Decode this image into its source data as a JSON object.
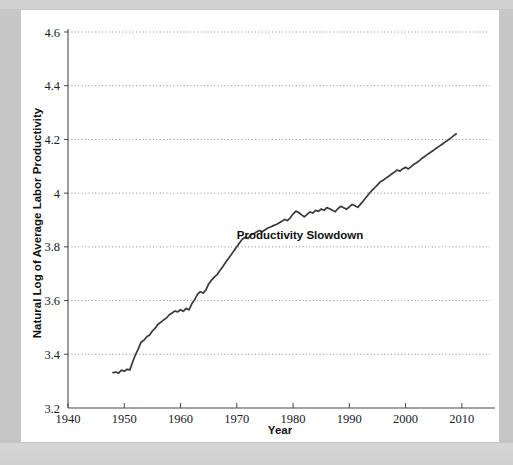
{
  "figure": {
    "background_color": "#c6c6c6",
    "card_color": "#ffffff",
    "line_color": "#3a3a38",
    "grid_color": "#8a8a8a",
    "axis_color": "#4a4a4a"
  },
  "chart_data": {
    "type": "line",
    "title": "",
    "xlabel": "Year",
    "ylabel": "Natural Log of Average Labor Productivity",
    "xlim": [
      1940,
      2015
    ],
    "ylim": [
      3.2,
      4.6
    ],
    "grid": "horizontal-dotted",
    "legend": "none",
    "xticks": [
      1940,
      1950,
      1960,
      1970,
      1980,
      1990,
      2000,
      2010
    ],
    "xtick_labels": [
      "1940",
      "1950",
      "1960",
      "1970",
      "1980",
      "1990",
      "2000",
      "2010"
    ],
    "yticks": [
      3.2,
      3.4,
      3.6,
      3.8,
      4.0,
      4.2,
      4.4,
      4.6
    ],
    "ytick_labels": [
      "3.2",
      "3.4",
      "3.6",
      "3.8",
      "4",
      "4.2",
      "4.4",
      "4.6"
    ],
    "annotations": [
      {
        "text": "Productivity Slowdown",
        "x": 1970.0,
        "y": 3.83
      }
    ],
    "series": [
      {
        "name": "Natural Log of Average Labor Productivity",
        "x": [
          1948.0,
          1948.5,
          1949.0,
          1949.5,
          1950.0,
          1950.5,
          1951.0,
          1951.5,
          1952.0,
          1952.5,
          1953.0,
          1953.5,
          1954.0,
          1954.5,
          1955.0,
          1955.5,
          1956.0,
          1956.5,
          1957.0,
          1957.5,
          1958.0,
          1958.5,
          1959.0,
          1959.5,
          1960.0,
          1960.5,
          1961.0,
          1961.5,
          1962.0,
          1962.5,
          1963.0,
          1963.5,
          1964.0,
          1964.5,
          1965.0,
          1965.5,
          1966.0,
          1966.5,
          1967.0,
          1967.5,
          1968.0,
          1968.5,
          1969.0,
          1969.5,
          1970.0,
          1970.5,
          1971.0,
          1971.5,
          1972.0,
          1972.5,
          1973.0,
          1973.5,
          1974.0,
          1974.5,
          1975.0,
          1975.5,
          1976.0,
          1976.5,
          1977.0,
          1977.5,
          1978.0,
          1978.5,
          1979.0,
          1979.5,
          1980.0,
          1980.5,
          1981.0,
          1981.5,
          1982.0,
          1982.5,
          1983.0,
          1983.5,
          1984.0,
          1984.5,
          1985.0,
          1985.5,
          1986.0,
          1986.5,
          1987.0,
          1987.5,
          1988.0,
          1988.5,
          1989.0,
          1989.5,
          1990.0,
          1990.5,
          1991.0,
          1991.5,
          1992.0,
          1992.5,
          1993.0,
          1993.5,
          1994.0,
          1994.5,
          1995.0,
          1995.5,
          1996.0,
          1996.5,
          1997.0,
          1997.5,
          1998.0,
          1998.5,
          1999.0,
          1999.5,
          2000.0,
          2000.5,
          2001.0,
          2001.5,
          2002.0,
          2002.5,
          2003.0,
          2003.5,
          2004.0,
          2004.5,
          2005.0,
          2005.5,
          2006.0,
          2006.5,
          2007.0,
          2007.5,
          2008.0,
          2008.5,
          2009.0
        ],
        "y": [
          3.332,
          3.334,
          3.33,
          3.341,
          3.337,
          3.344,
          3.342,
          3.372,
          3.399,
          3.42,
          3.446,
          3.452,
          3.465,
          3.472,
          3.487,
          3.497,
          3.512,
          3.519,
          3.528,
          3.535,
          3.547,
          3.554,
          3.561,
          3.558,
          3.566,
          3.56,
          3.571,
          3.565,
          3.588,
          3.603,
          3.623,
          3.633,
          3.628,
          3.639,
          3.662,
          3.676,
          3.687,
          3.697,
          3.712,
          3.726,
          3.742,
          3.757,
          3.771,
          3.786,
          3.8,
          3.815,
          3.829,
          3.836,
          3.831,
          3.845,
          3.849,
          3.855,
          3.861,
          3.856,
          3.863,
          3.87,
          3.874,
          3.879,
          3.883,
          3.889,
          3.895,
          3.902,
          3.898,
          3.908,
          3.922,
          3.933,
          3.928,
          3.919,
          3.912,
          3.921,
          3.93,
          3.926,
          3.936,
          3.932,
          3.941,
          3.936,
          3.946,
          3.942,
          3.936,
          3.931,
          3.943,
          3.951,
          3.946,
          3.94,
          3.949,
          3.958,
          3.953,
          3.947,
          3.959,
          3.972,
          3.985,
          3.998,
          4.01,
          4.02,
          4.031,
          4.042,
          4.048,
          4.056,
          4.063,
          4.071,
          4.078,
          4.086,
          4.082,
          4.091,
          4.096,
          4.09,
          4.099,
          4.108,
          4.114,
          4.122,
          4.131,
          4.138,
          4.146,
          4.153,
          4.16,
          4.168,
          4.175,
          4.182,
          4.19,
          4.197,
          4.205,
          4.213,
          4.221
        ]
      }
    ]
  }
}
